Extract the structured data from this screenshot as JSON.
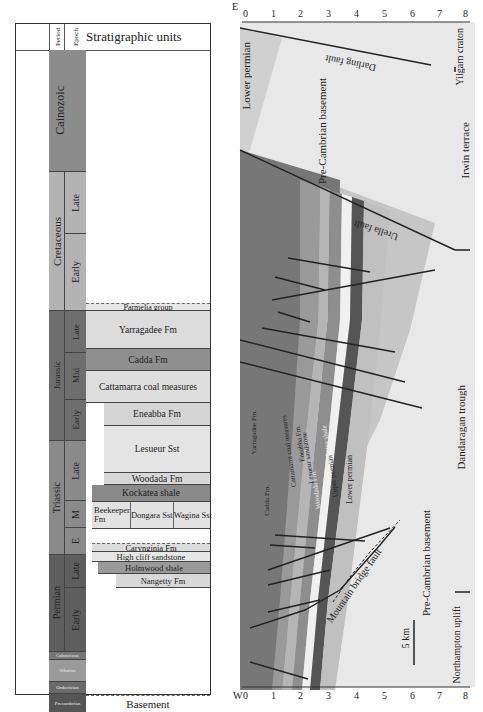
{
  "figure": {
    "left_panel": {
      "header": {
        "period_label": "Period",
        "epoch_label": "Epoch",
        "title": "Stratigraphic units"
      },
      "periods": [
        {
          "name": "Cainozoic",
          "color": "#8c8c8c"
        },
        {
          "name": "Cretaceous",
          "color": "#b3b3b3"
        },
        {
          "name": "Jurassic",
          "color": "#6e6e6e"
        },
        {
          "name": "Triassic",
          "color": "#8a8a8a"
        },
        {
          "name": "Permian",
          "color": "#5e5e5e"
        },
        {
          "name": "Carboniferous",
          "color": "#777777"
        },
        {
          "name": "Silurian",
          "color": "#9a9a9a"
        },
        {
          "name": "Ordovician",
          "color": "#6a6a6a"
        },
        {
          "name": "Precambrian",
          "color": "#555555"
        }
      ],
      "epochs": [
        {
          "period": "Cretaceous",
          "name": "Late"
        },
        {
          "period": "Cretaceous",
          "name": "Early"
        },
        {
          "period": "Jurassic",
          "name": "Late"
        },
        {
          "period": "Jurassic",
          "name": "Mid"
        },
        {
          "period": "Jurassic",
          "name": "Early"
        },
        {
          "period": "Triassic",
          "name": "Late"
        },
        {
          "period": "Triassic",
          "name": "M"
        },
        {
          "period": "Triassic",
          "name": "E"
        },
        {
          "period": "Permian",
          "name": "Late"
        },
        {
          "period": "Permian",
          "name": "Early"
        }
      ],
      "units": [
        {
          "name": "Parmelia group",
          "shade": "#e6e6e6"
        },
        {
          "name": "Yarragadee Fm",
          "shade": "#dcdcdc"
        },
        {
          "name": "Cadda Fm",
          "shade": "#8f8f8f"
        },
        {
          "name": "Cattamarra coal measures",
          "shade": "#dedede"
        },
        {
          "name": "Eneabba Fm",
          "shade": "#d4d4d4"
        },
        {
          "name": "Lesueur Sst",
          "shade": "#e4e4e4"
        },
        {
          "name": "Woodada Fm",
          "shade": "#d8d8d8"
        },
        {
          "name": "Kockatea shale",
          "shade": "#8a8a8a"
        },
        {
          "name": "Beekeeper Fm",
          "shade": "#e2e2e2"
        },
        {
          "name": "Dongara Sst",
          "shade": "#e2e2e2"
        },
        {
          "name": "Wagina Sst",
          "shade": "#e2e2e2"
        },
        {
          "name": "Carynginia Fm",
          "shade": "#dcdcdc"
        },
        {
          "name": "High cliff sandstone",
          "shade": "#e6e6e6"
        },
        {
          "name": "Holmwood shale",
          "shade": "#9a9a9a"
        },
        {
          "name": "Nangetty Fm",
          "shade": "#d8d8d8"
        },
        {
          "name": "Basement",
          "shade": "#ffffff"
        }
      ]
    },
    "right_panel": {
      "orientation_labels": {
        "east": "E",
        "west": "W"
      },
      "depth_ticks": [
        "0",
        "1",
        "2",
        "3",
        "4",
        "5",
        "6",
        "7",
        "8"
      ],
      "scale_bar": "5 km",
      "faults": [
        "Darling fault",
        "Urella fault",
        "Mountain bridge fault"
      ],
      "regions": [
        "Yilgarn craton",
        "Irwin terrace",
        "Dandaragan trough",
        "Northampton uplift"
      ],
      "layer_labels": [
        "Lower permian",
        "Pre-Cambrian basement",
        "Yarragadee Fm.",
        "Cadda Fm.",
        "Cattamarra coal measures",
        "Eneabba Fm.",
        "Lesueur sandstone",
        "Woodada Fm.",
        "Kockatea shale",
        "Upper permian",
        "Lower permian",
        "Pre-Cambrian basement"
      ],
      "colors": {
        "basement": "#e8e8e8",
        "lower_permian": "#d0d0d0",
        "yarragadee": "#777777",
        "cadda": "#9a9a9a",
        "cattamarra": "#b5b5b5",
        "eneabba": "#8e8e8e",
        "lesueur": "#f0f0f0",
        "kockatea": "#555555",
        "upper_permian": "#c0c0c0",
        "fault_line": "#222222"
      }
    }
  }
}
